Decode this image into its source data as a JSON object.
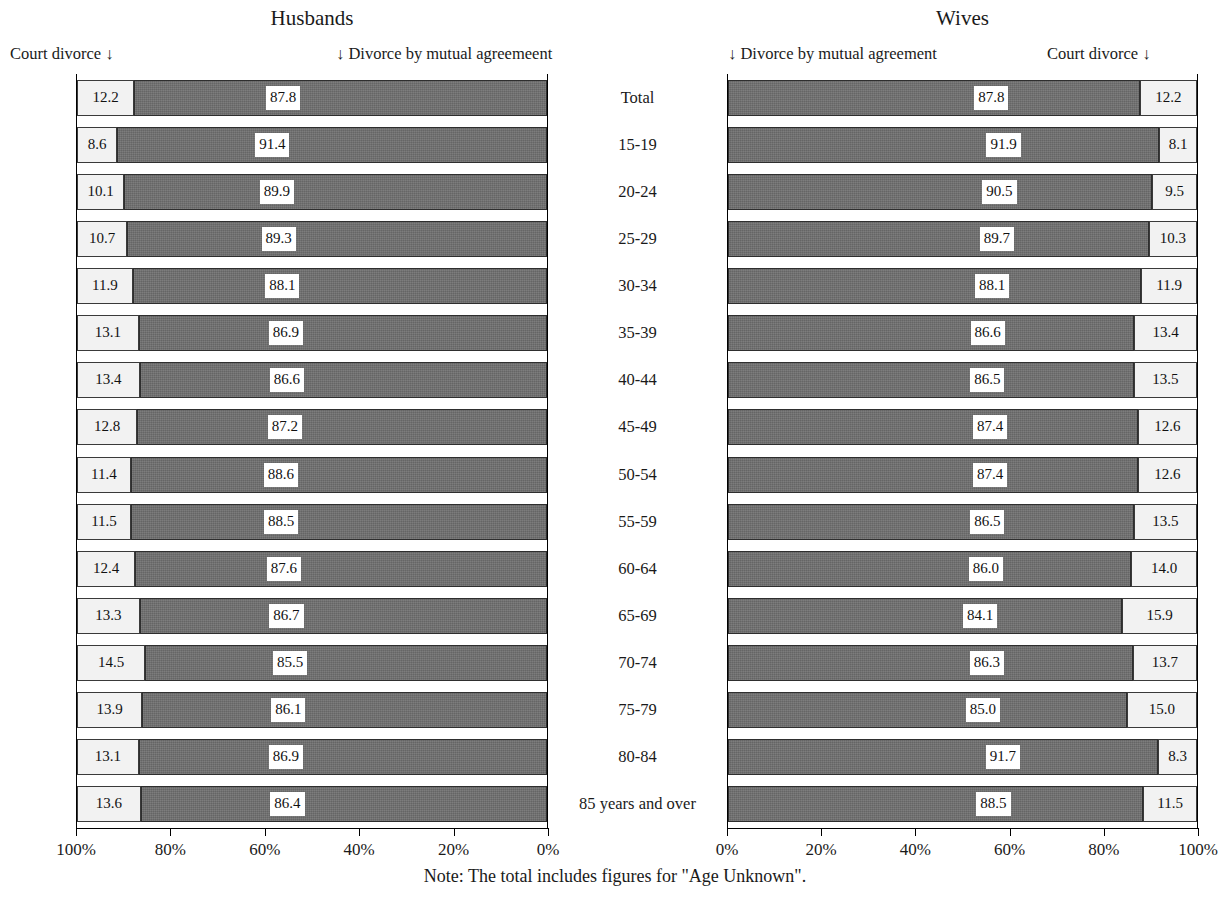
{
  "charts": {
    "left": {
      "title": "Husbands",
      "left_arrow_label": "Court divorce ↓",
      "right_arrow_label": "↓ Divorce by mutual agreemeent"
    },
    "right": {
      "title": "Wives",
      "left_arrow_label": "↓ Divorce by mutual agreement",
      "right_arrow_label": "Court divorce  ↓"
    }
  },
  "note": "Note: The total includes figures for \"Age Unknown\".",
  "axis": {
    "left_ticks": [
      "100%",
      "80%",
      "60%",
      "40%",
      "20%",
      "0%"
    ],
    "right_ticks": [
      "0%",
      "20%",
      "40%",
      "60%",
      "80%",
      "100%"
    ]
  },
  "colors": {
    "court_divorce": "#f2f2f2",
    "mutual_agreement": "#6e6e6e",
    "axis": "#000000",
    "text": "#1a1a1a"
  },
  "chart_data": [
    {
      "type": "bar",
      "orientation": "horizontal-stacked",
      "title": "Husbands",
      "subtitle": "",
      "xlabel": "",
      "ylabel": "",
      "xlim": [
        0,
        100
      ],
      "x_direction": "reversed",
      "grid": false,
      "legend": [
        "Court divorce",
        "Divorce by mutual agreemeent"
      ],
      "legend_position": "above-plot-arrows",
      "categories": [
        "Total",
        "15-19",
        "20-24",
        "25-29",
        "30-34",
        "35-39",
        "40-44",
        "45-49",
        "50-54",
        "55-59",
        "60-64",
        "65-69",
        "70-74",
        "75-79",
        "80-84",
        "85 years and over"
      ],
      "series": [
        {
          "name": "Court divorce",
          "values": [
            12.2,
            8.6,
            10.1,
            10.7,
            11.9,
            13.1,
            13.4,
            12.8,
            11.4,
            11.5,
            12.4,
            13.3,
            14.5,
            13.9,
            13.1,
            13.6
          ]
        },
        {
          "name": "Divorce by mutual agreemeent",
          "values": [
            87.8,
            91.4,
            89.9,
            89.3,
            88.1,
            86.9,
            86.6,
            87.2,
            88.6,
            88.5,
            87.6,
            86.7,
            85.5,
            86.1,
            86.9,
            86.4
          ]
        }
      ],
      "tick_labels": [
        "100%",
        "80%",
        "60%",
        "40%",
        "20%",
        "0%"
      ]
    },
    {
      "type": "bar",
      "orientation": "horizontal-stacked",
      "title": "Wives",
      "subtitle": "",
      "xlabel": "",
      "ylabel": "",
      "xlim": [
        0,
        100
      ],
      "x_direction": "normal",
      "grid": false,
      "legend": [
        "Divorce by mutual agreement",
        "Court divorce"
      ],
      "legend_position": "above-plot-arrows",
      "categories": [
        "Total",
        "15-19",
        "20-24",
        "25-29",
        "30-34",
        "35-39",
        "40-44",
        "45-49",
        "50-54",
        "55-59",
        "60-64",
        "65-69",
        "70-74",
        "75-79",
        "80-84",
        "85 years and over"
      ],
      "series": [
        {
          "name": "Divorce by mutual agreement",
          "values": [
            87.8,
            91.9,
            90.5,
            89.7,
            88.1,
            86.6,
            86.5,
            87.4,
            87.4,
            86.5,
            86.0,
            84.1,
            86.3,
            85.0,
            91.7,
            88.5
          ]
        },
        {
          "name": "Court divorce",
          "values": [
            12.2,
            8.1,
            9.5,
            10.3,
            11.9,
            13.4,
            13.5,
            12.6,
            12.6,
            13.5,
            14.0,
            15.9,
            13.7,
            15.0,
            8.3,
            11.5
          ]
        }
      ],
      "tick_labels": [
        "0%",
        "20%",
        "40%",
        "60%",
        "80%",
        "100%"
      ]
    }
  ]
}
